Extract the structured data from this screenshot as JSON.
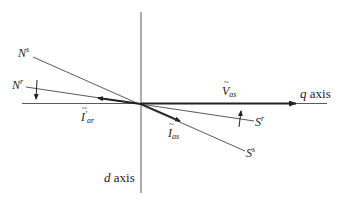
{
  "diagram": {
    "type": "phasor-diagram",
    "colors": {
      "line": "#5a5a5a",
      "thick": "#222222",
      "text": "#222222",
      "background": "#ffffff"
    },
    "axes": {
      "q_axis": {
        "label_var": "q",
        "label_word": "axis"
      },
      "d_axis": {
        "label_var": "d",
        "label_word": "axis"
      }
    },
    "phasors": [
      {
        "id": "V_as",
        "symbol": "V",
        "subscript": "as",
        "accent": "~"
      },
      {
        "id": "I_as",
        "symbol": "I",
        "subscript": "as",
        "accent": "~"
      },
      {
        "id": "I_ar",
        "symbol": "I",
        "subscript": "ar",
        "accent": "~",
        "prime": "′"
      }
    ],
    "poles": [
      {
        "id": "Ns",
        "letter": "N",
        "sup": "s"
      },
      {
        "id": "Nr",
        "letter": "N",
        "sup": "r"
      },
      {
        "id": "Sr",
        "letter": "S",
        "sup": "r"
      },
      {
        "id": "Ss",
        "letter": "S",
        "sup": "s"
      }
    ]
  }
}
